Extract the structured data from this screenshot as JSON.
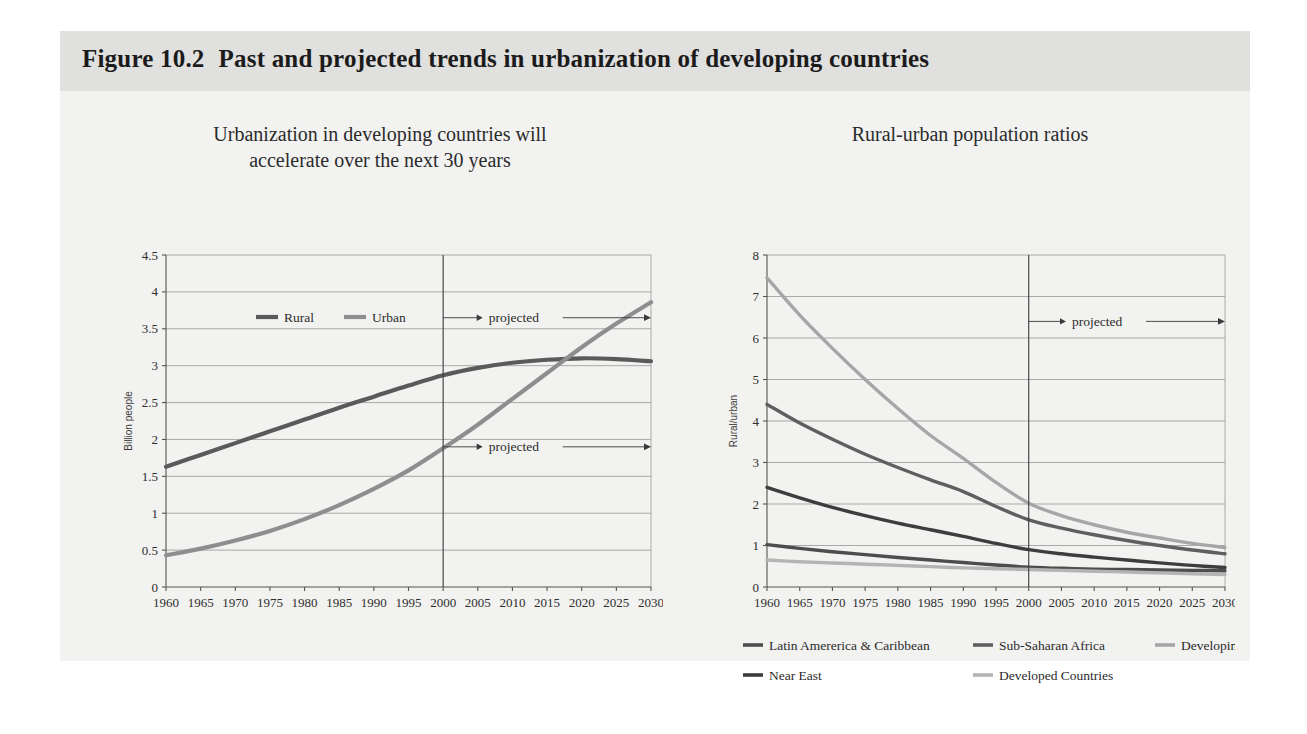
{
  "figure": {
    "number": "Figure 10.2",
    "title": "Past and projected trends in urbanization of developing countries"
  },
  "colors": {
    "card_bg": "#f2f2f0",
    "title_band": "#e0e0de",
    "rural": "#5a5a5a",
    "urban": "#8e8e8e",
    "latin_america": "#4d4d4d",
    "sub_saharan": "#5f5f5f",
    "developing_asia": "#a6a6a6",
    "near_east": "#3d3d3d",
    "developed": "#b4b4b4",
    "grid": "#8a8a8a",
    "axis": "#555555"
  },
  "left_panel": {
    "subtitle_line1": "Urbanization in developing countries will",
    "subtitle_line2": "accelerate over the next 30 years",
    "legend": [
      {
        "label": "Rural",
        "color": "#5a5a5a"
      },
      {
        "label": "Urban",
        "color": "#8e8e8e"
      }
    ],
    "projected_label": "projected",
    "projected_year": 2000
  },
  "right_panel": {
    "subtitle_line1": "Rural-urban population ratios",
    "projected_label": "projected",
    "projected_year": 2000,
    "legend": [
      {
        "label": "Latin Amererica & Caribbean",
        "color": "#4d4d4d"
      },
      {
        "label": "Sub-Saharan Africa",
        "color": "#5f5f5f"
      },
      {
        "label": "Developing Asia",
        "color": "#a6a6a6"
      },
      {
        "label": "Near East",
        "color": "#3d3d3d"
      },
      {
        "label": "Developed Countries",
        "color": "#b4b4b4"
      }
    ]
  },
  "chart_data": [
    {
      "id": "left",
      "type": "line",
      "title": "Urbanization in developing countries will accelerate over the next 30 years",
      "xlabel": "",
      "ylabel": "Billion people",
      "xlim": [
        1960,
        2030
      ],
      "ylim": [
        0,
        4.5
      ],
      "ytick_step": 0.5,
      "yticks": [
        0,
        0.5,
        1,
        1.5,
        2,
        2.5,
        3,
        3.5,
        4,
        4.5
      ],
      "grid": true,
      "legend_position": "inside-top-left",
      "annotations": [
        {
          "text": "projected",
          "from_year": 2000,
          "to_year": 2030,
          "y": 3.65
        },
        {
          "text": "projected",
          "from_year": 2000,
          "to_year": 2030,
          "y": 1.9
        }
      ],
      "x": [
        1960,
        1965,
        1970,
        1975,
        1980,
        1985,
        1990,
        1995,
        2000,
        2005,
        2010,
        2015,
        2020,
        2025,
        2030
      ],
      "series": [
        {
          "name": "Rural",
          "color": "#5a5a5a",
          "values": [
            1.63,
            1.79,
            1.95,
            2.11,
            2.27,
            2.43,
            2.58,
            2.73,
            2.87,
            2.97,
            3.04,
            3.08,
            3.1,
            3.09,
            3.06
          ]
        },
        {
          "name": "Urban",
          "color": "#8e8e8e",
          "values": [
            0.43,
            0.52,
            0.63,
            0.76,
            0.92,
            1.11,
            1.33,
            1.58,
            1.88,
            2.2,
            2.55,
            2.9,
            3.25,
            3.57,
            3.86
          ]
        }
      ]
    },
    {
      "id": "right",
      "type": "line",
      "title": "Rural-urban population ratios",
      "xlabel": "",
      "ylabel": "Rural/urban",
      "xlim": [
        1960,
        2030
      ],
      "ylim": [
        0,
        8
      ],
      "ytick_step": 1,
      "yticks": [
        0,
        1,
        2,
        3,
        4,
        5,
        6,
        7,
        8
      ],
      "grid": true,
      "legend_position": "below",
      "annotations": [
        {
          "text": "projected",
          "from_year": 2000,
          "to_year": 2030,
          "y": 6.4
        }
      ],
      "x": [
        1960,
        1965,
        1970,
        1975,
        1980,
        1985,
        1990,
        1995,
        2000,
        2005,
        2010,
        2015,
        2020,
        2025,
        2030
      ],
      "series": [
        {
          "name": "Developing Asia",
          "color": "#a6a6a6",
          "values": [
            7.45,
            6.55,
            5.75,
            5.0,
            4.3,
            3.65,
            3.1,
            2.52,
            2.02,
            1.72,
            1.5,
            1.32,
            1.18,
            1.05,
            0.95
          ]
        },
        {
          "name": "Sub-Saharan Africa",
          "color": "#5f5f5f",
          "values": [
            4.4,
            3.95,
            3.56,
            3.2,
            2.88,
            2.58,
            2.3,
            1.94,
            1.62,
            1.42,
            1.26,
            1.12,
            1.0,
            0.89,
            0.8
          ]
        },
        {
          "name": "Near East",
          "color": "#3d3d3d",
          "values": [
            2.4,
            2.15,
            1.92,
            1.72,
            1.54,
            1.38,
            1.22,
            1.05,
            0.9,
            0.8,
            0.72,
            0.65,
            0.58,
            0.52,
            0.47
          ]
        },
        {
          "name": "Latin Amererica & Caribbean",
          "color": "#4d4d4d",
          "values": [
            1.02,
            0.93,
            0.85,
            0.78,
            0.71,
            0.65,
            0.59,
            0.53,
            0.48,
            0.45,
            0.43,
            0.42,
            0.41,
            0.4,
            0.39
          ]
        },
        {
          "name": "Developed Countries",
          "color": "#b4b4b4",
          "values": [
            0.65,
            0.61,
            0.58,
            0.55,
            0.52,
            0.49,
            0.46,
            0.44,
            0.42,
            0.4,
            0.38,
            0.36,
            0.34,
            0.32,
            0.3
          ]
        }
      ]
    }
  ],
  "xtick_labels": [
    "1960",
    "1965",
    "1970",
    "1975",
    "1980",
    "1985",
    "1990",
    "1995",
    "2000",
    "2005",
    "2010",
    "2015",
    "2020",
    "2025",
    "2030"
  ]
}
